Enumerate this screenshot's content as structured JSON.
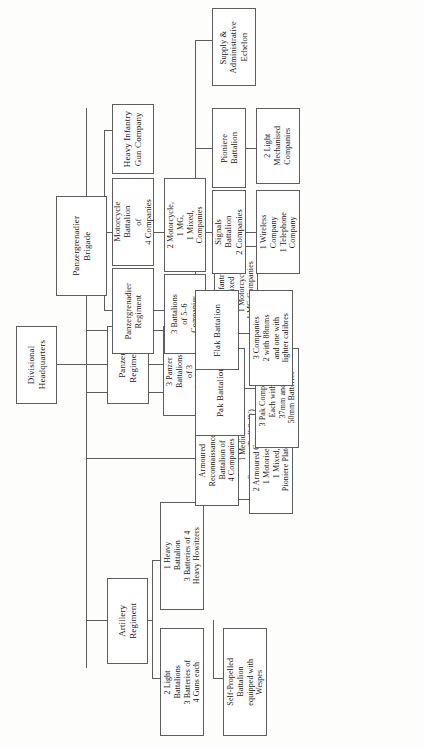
{
  "diagram": {
    "orientation": "rotated-90-ccw",
    "nodes": {
      "divisional_hq": "Divisional\nHeadquarters",
      "panzer_regiment": "Panzer\nRegiment",
      "panzer_regiment_detail": "3 Panzer\nBattalions\nof 3\nCompanies",
      "panzer_regiment_subdetail": "2 Light (Pz II & III)\nCompanies\n1 Medium\nCompany (Pz II & IV)",
      "panzergrenadier_brigade": "Panzergrenadier\nBrigade",
      "panzergrenadier_regiment": "Panzergrenadier\nRegiment",
      "panzergrenadier_regiment_detail": "3 Battalions\nof 5–6\nCompanies",
      "panzergrenadier_regiment_subdetail": "2/3 Infantry\n1 Mixed\n1 Motorcycle\n1 MG Companies",
      "motorcycle_battalion": "Motorcycle\nBattalion\nof\n4 Companies",
      "motorcycle_battalion_detail": "2 Motorcycle,\n1 MG,\n1 Mixed,\nCompanies",
      "heavy_infantry_gun_company": "Heavy Infantry\nGun Company",
      "artillery_regiment": "Artillery\nRegiment",
      "artillery_light": "2 Light\nBattalions\n3 Batteries of\n4 Guns each",
      "artillery_heavy": "1 Heavy\nBattalion\n3 Batteries of 4\nHeavy Howitzers",
      "artillery_selfpropelled": "Self-Propelled\nBattalion\nequipped with\nWespes",
      "armoured_reconnaissance": "Armoured\nReconnaissance\nBattalion of\n4 Companies",
      "armoured_reconnaissance_detail": "2 Armoured Car,\n1 Motorised,\n1 Mixed,\nPioniere Platoon",
      "pak_battalion": "Pak Battalion",
      "pak_battalion_detail": "3 Pak Companies\nEach with 1\n37mm and 2\n50mm Batteries",
      "flak_battalion": "Flak Battalion",
      "flak_battalion_detail": "3 Companies\n2 with 88mms\nand one with\nlighter calibres",
      "signals_battalion": "Signals\nBattalion\n2 Companies",
      "signals_battalion_detail": "1 Wireless\nCompany\n1 Telephone\nCompany",
      "pioniere_battalion": "Pioniere\nBattalion",
      "pioniere_battalion_detail": "2 Light\nMechanised\nCompanies",
      "supply_administrative_echelon": "Supply &\nAdministrative\nEchelon"
    },
    "colors": {
      "border": "#5d5d5d",
      "box_fill": "#ffffff",
      "text": "#171717",
      "page": "#fdfdfb"
    }
  }
}
